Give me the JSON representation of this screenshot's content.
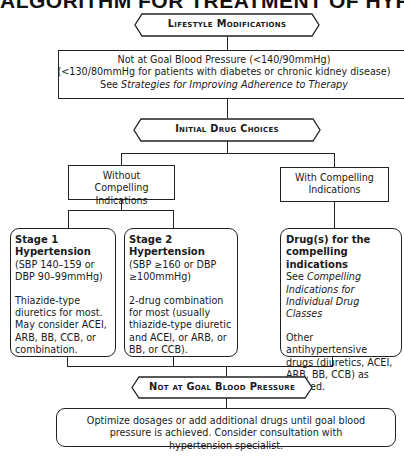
{
  "title": "ALGORITHM FOR TREATMENT OF HYPERTENSION",
  "nodes": {
    "lifestyle": "Lifestyle Modifications",
    "not_at_goal_1": {
      "line1": "Not at Goal Blood Pressure (<140/90mmHg)",
      "line2": "(<130/80mmHg for patients with diabetes or chronic kidney disease)",
      "see_prefix": "See ",
      "see_link": "Strategies for Improving Adherence to Therapy"
    },
    "initial_drug_choices": "Initial Drug Choices",
    "without_compelling": "Without Compelling Indications",
    "with_compelling": "With Compelling Indications",
    "stage1": {
      "heading": "Stage 1 Hypertension",
      "criteria": "(SBP 140–159 or DBP 90–99mmHg)",
      "treatment": "Thiazide-type diuretics for most. May consider ACEI, ARB, BB, CCB, or combination."
    },
    "stage2": {
      "heading": "Stage 2 Hypertension",
      "criteria": "(SBP ≥160 or DBP ≥100mmHg)",
      "treatment": "2-drug combination for most (usually thiazide-type diuretic and ACEI, or ARB, or BB, or CCB)."
    },
    "compelling": {
      "heading": "Drug(s) for the compelling indications",
      "see_prefix": "See ",
      "see_link": "Compelling Indications for Individual Drug Classes",
      "other": "Other antihypertensive drugs (diuretics, ACEI, ARB, BB, CCB) as needed."
    },
    "not_at_goal_2": "Not at Goal Blood Pressure",
    "optimize": "Optimize dosages or add additional drugs until goal blood pressure is achieved. Consider consultation with hypertension specialist."
  }
}
